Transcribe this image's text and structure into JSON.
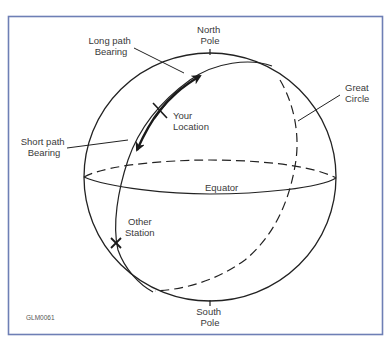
{
  "diagram": {
    "type": "great-circle-bearing",
    "frame_color": "#6e7fb5",
    "line_color": "#222222",
    "labels": {
      "north_pole": [
        "North",
        "Pole"
      ],
      "south_pole": [
        "South",
        "Pole"
      ],
      "long_path": [
        "Long path",
        "Bearing"
      ],
      "short_path": [
        "Short path",
        "Bearing"
      ],
      "your_location": [
        "Your",
        "Location"
      ],
      "other_station": [
        "Other",
        "Station"
      ],
      "great_circle": [
        "Great",
        "Circle"
      ],
      "equator": "Equator",
      "figure_id": "GLM0061"
    }
  }
}
